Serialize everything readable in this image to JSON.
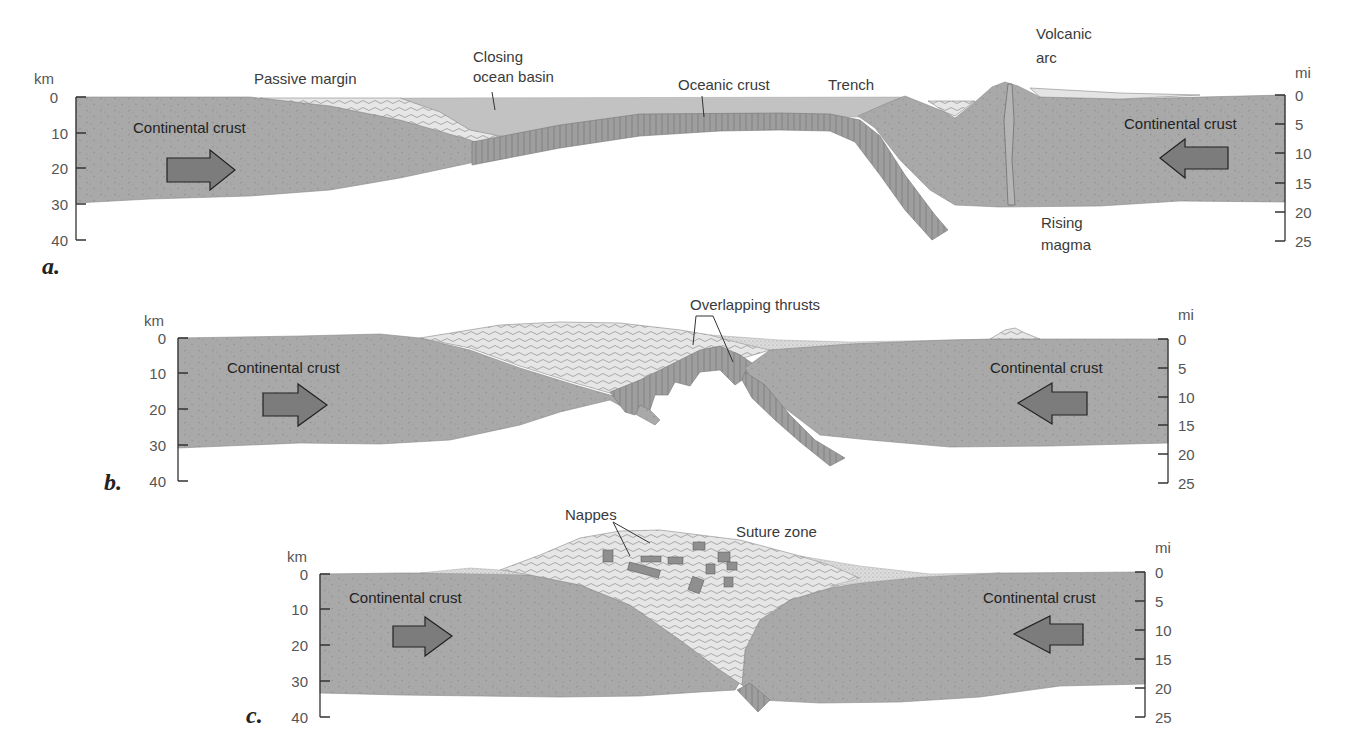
{
  "figure": {
    "colors": {
      "continental_crust": "#a9a9a9",
      "oceanic_crust": "#9b9b9b",
      "sediment": "#e4e4e4",
      "ocean_water": "#c2c2c2",
      "arrow": "#7c7c7c",
      "text": "#3a3a3a"
    },
    "panels": [
      {
        "letter": "a.",
        "left_axis": {
          "unit": "km",
          "ticks": [
            "0",
            "10",
            "20",
            "30",
            "40"
          ]
        },
        "right_axis": {
          "unit": "mi",
          "ticks": [
            "0",
            "5",
            "10",
            "15",
            "20",
            "25"
          ]
        },
        "labels": {
          "passive_margin": "Passive margin",
          "closing_ocean_basin_1": "Closing",
          "closing_ocean_basin_2": "ocean basin",
          "oceanic_crust": "Oceanic crust",
          "trench": "Trench",
          "volcanic_arc_1": "Volcanic",
          "volcanic_arc_2": "arc",
          "rising_magma_1": "Rising",
          "rising_magma_2": "magma",
          "continental_crust_left": "Continental crust",
          "continental_crust_right": "Continental crust"
        },
        "arrows": {
          "left": "right-arrow",
          "right": "left-arrow"
        }
      },
      {
        "letter": "b.",
        "left_axis": {
          "unit": "km",
          "ticks": [
            "0",
            "10",
            "20",
            "30",
            "40"
          ]
        },
        "right_axis": {
          "unit": "mi",
          "ticks": [
            "0",
            "5",
            "10",
            "15",
            "20",
            "25"
          ]
        },
        "labels": {
          "overlapping_thrusts": "Overlapping thrusts",
          "continental_crust_left": "Continental crust",
          "continental_crust_right": "Continental crust"
        },
        "arrows": {
          "left": "right-arrow",
          "right": "left-arrow"
        }
      },
      {
        "letter": "c.",
        "left_axis": {
          "unit": "km",
          "ticks": [
            "0",
            "10",
            "20",
            "30",
            "40"
          ]
        },
        "right_axis": {
          "unit": "mi",
          "ticks": [
            "0",
            "5",
            "10",
            "15",
            "20",
            "25"
          ]
        },
        "labels": {
          "nappes": "Nappes",
          "suture_zone": "Suture zone",
          "continental_crust_left": "Continental crust",
          "continental_crust_right": "Continental crust"
        },
        "arrows": {
          "left": "right-arrow",
          "right": "left-arrow"
        }
      }
    ]
  }
}
